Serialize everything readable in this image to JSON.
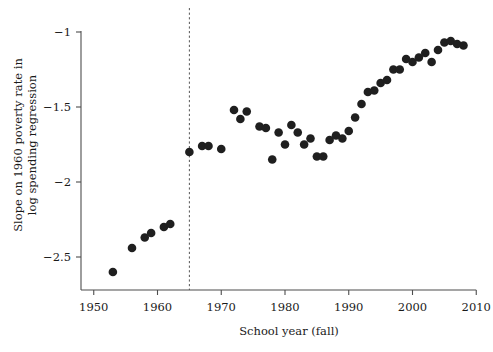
{
  "chart_data": {
    "type": "scatter",
    "title": "",
    "xlabel": "School year (fall)",
    "ylabel_line1": "Slope on 1960 poverty rate in",
    "ylabel_line2": "log spending regression",
    "ylabel": "Slope on 1960 poverty rate in log spending regression",
    "xlim": [
      1948,
      2012
    ],
    "ylim": [
      -2.72,
      -0.92
    ],
    "xticks": [
      1950,
      1960,
      1970,
      1980,
      1990,
      2000,
      2010
    ],
    "xtick_labels": [
      "1950",
      "1960",
      "1970",
      "1980",
      "1990",
      "2000",
      "2010"
    ],
    "yticks": [
      -1,
      -1.5,
      -2,
      -2.5
    ],
    "ytick_labels": [
      "−1",
      "−1.5",
      "−2",
      "−2.5"
    ],
    "grid": false,
    "legend": null,
    "marker": "filled-circle",
    "marker_color": "#1f1f1f",
    "marker_size_px": 4.3,
    "annotations": [
      {
        "name": "cutoff-line",
        "type": "vertical-dashed-line",
        "x": 1965,
        "style": "dashed",
        "color": "#555555"
      }
    ],
    "x": [
      1953,
      1956,
      1958,
      1959,
      1961,
      1962,
      1965,
      1967,
      1968,
      1970,
      1972,
      1973,
      1974,
      1976,
      1977,
      1978,
      1979,
      1980,
      1981,
      1982,
      1983,
      1984,
      1985,
      1986,
      1987,
      1988,
      1989,
      1990,
      1991,
      1992,
      1993,
      1994,
      1995,
      1996,
      1997,
      1998,
      1999,
      2000,
      2001,
      2002,
      2003,
      2004,
      2005,
      2006,
      2007,
      2008
    ],
    "y": [
      -2.6,
      -2.44,
      -2.37,
      -2.34,
      -2.3,
      -2.28,
      -1.8,
      -1.76,
      -1.76,
      -1.78,
      -1.52,
      -1.58,
      -1.53,
      -1.63,
      -1.64,
      -1.85,
      -1.67,
      -1.75,
      -1.62,
      -1.67,
      -1.75,
      -1.71,
      -1.83,
      -1.83,
      -1.72,
      -1.69,
      -1.71,
      -1.66,
      -1.57,
      -1.48,
      -1.4,
      -1.39,
      -1.34,
      -1.32,
      -1.25,
      -1.25,
      -1.18,
      -1.2,
      -1.17,
      -1.14,
      -1.2,
      -1.12,
      -1.07,
      -1.06,
      -1.08,
      -1.09
    ],
    "n_points": 46,
    "series_name": "Slope estimate by school year"
  }
}
